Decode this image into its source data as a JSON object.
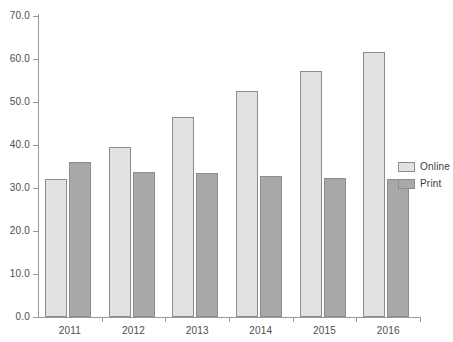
{
  "chart_data": {
    "type": "bar",
    "title": "",
    "subtitle": "",
    "xlabel": "",
    "ylabel": "",
    "categories": [
      "2011",
      "2012",
      "2013",
      "2014",
      "2015",
      "2016"
    ],
    "series": [
      {
        "name": "Online",
        "color": "#e2e2e2",
        "values": [
          32.0,
          39.5,
          46.4,
          52.6,
          57.3,
          61.7
        ]
      },
      {
        "name": "Print",
        "color": "#a8a8a8",
        "values": [
          36.0,
          33.7,
          33.5,
          32.8,
          32.3,
          32.0
        ]
      }
    ],
    "ylim": [
      0.0,
      70.0
    ],
    "ytick_values": [
      0.0,
      10.0,
      20.0,
      30.0,
      40.0,
      50.0,
      60.0,
      70.0
    ],
    "ytick_labels": [
      "0.0",
      "10.0",
      "20.0",
      "30.0",
      "40.0",
      "50.0",
      "60.0",
      "70.0"
    ],
    "xtick_labels": [
      "2011",
      "2012",
      "2013",
      "2014",
      "2015",
      "2016"
    ],
    "grid": false,
    "legend_position": "right",
    "legend_entries": [
      "Online",
      "Print"
    ],
    "annotations": []
  },
  "axes": {
    "y_axis_name": "value-axis",
    "x_axis_name": "category-axis"
  }
}
